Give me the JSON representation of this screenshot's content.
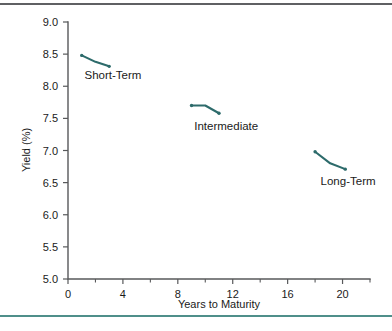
{
  "chart_data": {
    "type": "line",
    "title": "",
    "subtitle": "",
    "xlabel": "Years to Maturity",
    "ylabel": "Yield (%)",
    "xlim": [
      0,
      22
    ],
    "ylim": [
      5.0,
      9.0
    ],
    "grid": false,
    "legend_position": "inline-annotations",
    "x_ticks_major": [
      0,
      4,
      8,
      12,
      16,
      20
    ],
    "x_tick_labels": [
      "0",
      "4",
      "8",
      "12",
      "16",
      "20"
    ],
    "x_ticks_minor": [
      2,
      6,
      10,
      14,
      18,
      22
    ],
    "y_ticks": [
      5.0,
      5.5,
      6.0,
      6.5,
      7.0,
      7.5,
      8.0,
      8.5,
      9.0
    ],
    "y_tick_labels": [
      "5.0",
      "5.5",
      "6.0",
      "6.5",
      "7.0",
      "7.5",
      "8.0",
      "8.5",
      "9.0"
    ],
    "series": [
      {
        "name": "Short-Term",
        "color": "#2d6b6b",
        "x": [
          1.0,
          2.0,
          3.0
        ],
        "y": [
          8.48,
          8.38,
          8.31
        ],
        "annotation": "Short-Term",
        "annotation_x": 1.2,
        "annotation_y": 8.12
      },
      {
        "name": "Intermediate",
        "color": "#2d6b6b",
        "x": [
          9.0,
          10.0,
          11.0
        ],
        "y": [
          7.7,
          7.7,
          7.58
        ],
        "annotation": "Intermediate",
        "annotation_x": 9.2,
        "annotation_y": 7.32
      },
      {
        "name": "Long-Term",
        "color": "#2d6b6b",
        "x": [
          18.0,
          19.1,
          20.2
        ],
        "y": [
          6.98,
          6.8,
          6.71
        ],
        "annotation": "Long-Term",
        "annotation_x": 18.4,
        "annotation_y": 6.46
      }
    ]
  },
  "decor": {
    "rule_top_color": "#5f6063",
    "rule_bottom_color": "#4f8f8a"
  }
}
